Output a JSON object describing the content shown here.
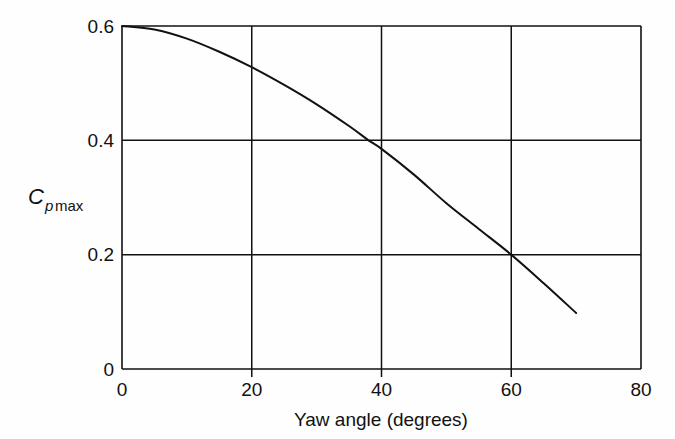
{
  "figure": {
    "background_color": "#fefefe",
    "ink_color": "#111111"
  },
  "chart_data": {
    "type": "line",
    "title": "",
    "subtitle": "",
    "xlabel": "Yaw angle (degrees)",
    "ylabel": "Cp max",
    "ylabel_parts": {
      "main": "C",
      "sub_italic": "p",
      "sub_roman": "max"
    },
    "xlim": [
      0,
      80
    ],
    "ylim": [
      0,
      0.6
    ],
    "xticks": [
      0,
      20,
      40,
      60,
      80
    ],
    "yticks": [
      0,
      0.2,
      0.4,
      0.6
    ],
    "xtick_labels": [
      "0",
      "20",
      "40",
      "60",
      "80"
    ],
    "ytick_labels": [
      "0",
      "0.2",
      "0.4",
      "0.6"
    ],
    "grid": true,
    "grid_x_values": [
      20,
      40,
      60
    ],
    "grid_y_values": [
      0.2,
      0.4
    ],
    "legend": null,
    "legend_position": "none",
    "annotations": [],
    "series": [
      {
        "name": "Cp max vs yaw angle",
        "x": [
          0,
          5,
          10,
          15,
          20,
          25,
          30,
          35,
          38,
          40,
          45,
          50,
          55,
          60,
          65,
          70
        ],
        "values": [
          0.6,
          0.594,
          0.578,
          0.555,
          0.528,
          0.497,
          0.463,
          0.425,
          0.4,
          0.385,
          0.34,
          0.29,
          0.245,
          0.2,
          0.15,
          0.098
        ]
      }
    ]
  }
}
